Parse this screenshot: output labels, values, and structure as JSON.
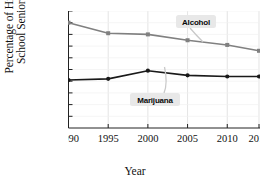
{
  "chart_data": {
    "type": "line",
    "title": "",
    "xlabel": "Year",
    "ylabel": "Percentage of High School Seniors",
    "ylabel_line1": "Percentage of High",
    "ylabel_line2": "School Seniors",
    "x": [
      1990,
      1995,
      2000,
      2005,
      2010,
      2014
    ],
    "xtick_labels": [
      "1990",
      "1995",
      "2000",
      "2005",
      "2010",
      "2014"
    ],
    "xlim": [
      1990,
      2014
    ],
    "ylim": [
      0,
      100
    ],
    "ytick_values": [
      10,
      20,
      30,
      40,
      50,
      60,
      70,
      80,
      90,
      100
    ],
    "ytick_labels": [
      "10%",
      "20%",
      "30%",
      "40%",
      "50%",
      "60%",
      "70%",
      "80%",
      "90%",
      "100%"
    ],
    "grid": "vertical gridlines at x ticks, faint horizontal gridlines",
    "legend": "none (inline callout annotations)",
    "series": [
      {
        "name": "Alcohol",
        "color": "#808080",
        "marker": "square",
        "values": [
          90,
          81,
          80,
          75,
          71,
          66
        ]
      },
      {
        "name": "Marijuana",
        "color": "#1a1a1a",
        "marker": "circle",
        "values": [
          41,
          42,
          49,
          45,
          44,
          44
        ]
      }
    ],
    "annotations": [
      {
        "label": "Alcohol",
        "points_to_year": 2005,
        "points_to_value": 75,
        "background": "#e8e8e8"
      },
      {
        "label": "Marijuana",
        "points_to_year": 2000,
        "points_to_value": 49,
        "background": "#e8e8e8"
      }
    ]
  },
  "axis": {
    "x_title": "Year",
    "y_title_line1": "Percentage of High",
    "y_title_line2": "School Seniors"
  }
}
